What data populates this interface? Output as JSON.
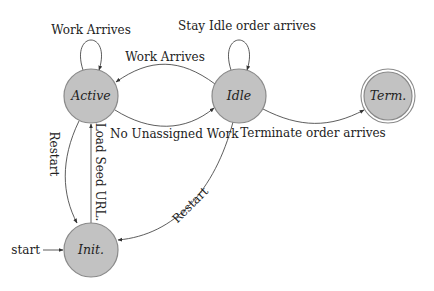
{
  "diagram": {
    "type": "state-machine",
    "colors": {
      "state_fill": "#c2c2c2",
      "state_stroke": "#8a8a8a",
      "edge": "#333333",
      "text": "#222222"
    },
    "states": [
      {
        "id": "active",
        "label": "Active",
        "final": false
      },
      {
        "id": "idle",
        "label": "Idle",
        "final": false
      },
      {
        "id": "term",
        "label": "Term.",
        "final": true
      },
      {
        "id": "init",
        "label": "Init.",
        "final": false,
        "initial": true
      }
    ],
    "start_label": "start",
    "transitions": [
      {
        "from": "active",
        "to": "active",
        "label": "Work Arrives"
      },
      {
        "from": "idle",
        "to": "idle",
        "label": "Stay Idle order arrives"
      },
      {
        "from": "idle",
        "to": "active",
        "label": "Work Arrives"
      },
      {
        "from": "active",
        "to": "idle",
        "label": "No Unassigned Work"
      },
      {
        "from": "idle",
        "to": "term",
        "label": "Terminate order arrives"
      },
      {
        "from": "active",
        "to": "init",
        "label": "Restart"
      },
      {
        "from": "init",
        "to": "active",
        "label": "Load Seed URL."
      },
      {
        "from": "idle",
        "to": "init",
        "label": "Restart"
      }
    ]
  }
}
